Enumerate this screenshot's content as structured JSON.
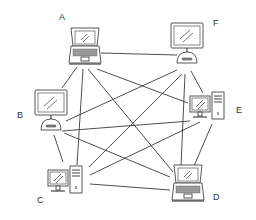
{
  "diagram": {
    "type": "full-mesh network",
    "nodes": [
      {
        "id": "A",
        "label": "A",
        "device": "laptop",
        "label_x": 59,
        "label_y": 13,
        "cx": 85,
        "cy": 48
      },
      {
        "id": "F",
        "label": "F",
        "device": "imac",
        "label_x": 213,
        "label_y": 19,
        "cx": 187,
        "cy": 45
      },
      {
        "id": "B",
        "label": "B",
        "device": "imac",
        "label_x": 17,
        "label_y": 111,
        "cx": 51,
        "cy": 112
      },
      {
        "id": "E",
        "label": "E",
        "device": "desktop-tower",
        "label_x": 236,
        "label_y": 106,
        "cx": 210,
        "cy": 108
      },
      {
        "id": "C",
        "label": "C",
        "device": "desktop-tower",
        "label_x": 37,
        "label_y": 196,
        "cx": 68,
        "cy": 182
      },
      {
        "id": "D",
        "label": "D",
        "device": "laptop",
        "label_x": 213,
        "label_y": 193,
        "cx": 188,
        "cy": 185
      }
    ],
    "edges": [
      {
        "from": "A",
        "to": "F",
        "x1": 101,
        "y1": 53,
        "x2": 177,
        "y2": 55
      },
      {
        "from": "A",
        "to": "B",
        "x1": 77,
        "y1": 67,
        "x2": 62,
        "y2": 88
      },
      {
        "from": "A",
        "to": "C",
        "x1": 83,
        "y1": 69,
        "x2": 77,
        "y2": 165
      },
      {
        "from": "A",
        "to": "D",
        "x1": 88,
        "y1": 69,
        "x2": 173,
        "y2": 172
      },
      {
        "from": "A",
        "to": "E",
        "x1": 97,
        "y1": 69,
        "x2": 188,
        "y2": 103
      },
      {
        "from": "F",
        "to": "B",
        "x1": 177,
        "y1": 70,
        "x2": 66,
        "y2": 121
      },
      {
        "from": "F",
        "to": "C",
        "x1": 182,
        "y1": 74,
        "x2": 89,
        "y2": 167
      },
      {
        "from": "F",
        "to": "D",
        "x1": 185,
        "y1": 74,
        "x2": 181,
        "y2": 166
      },
      {
        "from": "F",
        "to": "E",
        "x1": 191,
        "y1": 71,
        "x2": 203,
        "y2": 93
      },
      {
        "from": "B",
        "to": "E",
        "x1": 62,
        "y1": 131,
        "x2": 190,
        "y2": 121
      },
      {
        "from": "B",
        "to": "D",
        "x1": 64,
        "y1": 133,
        "x2": 170,
        "y2": 177
      },
      {
        "from": "B",
        "to": "C",
        "x1": 54,
        "y1": 135,
        "x2": 63,
        "y2": 162
      },
      {
        "from": "E",
        "to": "C",
        "x1": 200,
        "y1": 122,
        "x2": 90,
        "y2": 175
      },
      {
        "from": "E",
        "to": "D",
        "x1": 212,
        "y1": 124,
        "x2": 194,
        "y2": 166
      },
      {
        "from": "C",
        "to": "D",
        "x1": 90,
        "y1": 184,
        "x2": 170,
        "y2": 190
      }
    ]
  }
}
